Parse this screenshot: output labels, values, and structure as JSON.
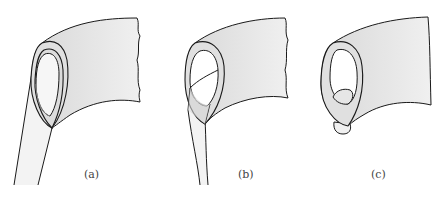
{
  "figure": {
    "panels": [
      {
        "id": "a",
        "label": "(a)",
        "description": "Tube with elliptical opening attached to a thin strip extending downward-left"
      },
      {
        "id": "b",
        "label": "(b)",
        "description": "Opening with inner curve crossing; strip narrowed"
      },
      {
        "id": "c",
        "label": "(c)",
        "description": "Opening with small pinched lobe at bottom; strip detached"
      }
    ],
    "colors": {
      "stroke": "#1a1a1a",
      "fill_surface": "#e6e6e6",
      "fill_inner": "#d9d9d9",
      "fill_strip": "#f2f2f2",
      "fill_hole": "#ffffff",
      "inner_line": "#888888"
    }
  }
}
